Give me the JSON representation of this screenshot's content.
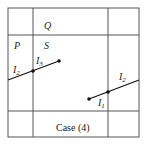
{
  "diagram": {
    "caption": "Case (4)",
    "regions": {
      "top_label": "Q",
      "left_label": "P",
      "center_label": "S"
    },
    "segments": [
      {
        "label_left": "I",
        "label_left_sub": "2",
        "label_right": "I",
        "label_right_sub": "3"
      },
      {
        "label_upper": "I",
        "label_upper_sub": "2",
        "label_lower": "I",
        "label_lower_sub": "1"
      }
    ],
    "colors": {
      "grid": "#555555",
      "segment": "#111111"
    }
  }
}
